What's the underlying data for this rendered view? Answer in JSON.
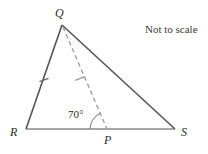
{
  "figure": {
    "type": "geometry-diagram",
    "background_color": "#ffffff",
    "note": "Not to scale",
    "solid_stroke_color": "#555555",
    "dashed_stroke_color": "#9a9a9a",
    "baseline_stroke_color": "#8a8a8a",
    "label_color": "#2b2b2b",
    "vertices": [
      {
        "name": "Q",
        "label": "Q",
        "x": 62,
        "y": 25,
        "label_x": 55,
        "label_y": 7
      },
      {
        "name": "R",
        "label": "R",
        "x": 26,
        "y": 129,
        "label_x": 10,
        "label_y": 126
      },
      {
        "name": "S",
        "label": "S",
        "x": 175,
        "y": 129,
        "label_x": 181,
        "label_y": 126
      },
      {
        "name": "P",
        "label": "P",
        "x": 107,
        "y": 129,
        "label_x": 104,
        "label_y": 134
      }
    ],
    "segments": [
      {
        "name": "side-RQ",
        "from": "R",
        "to": "Q",
        "style": "solid",
        "ticks": 1
      },
      {
        "name": "side-QS",
        "from": "Q",
        "to": "S",
        "style": "solid",
        "ticks": 0
      },
      {
        "name": "base-RS",
        "from": "R",
        "to": "S",
        "style": "solid",
        "ticks": 0
      },
      {
        "name": "cevian-QP",
        "from": "Q",
        "to": "P",
        "style": "dashed",
        "ticks": 1
      }
    ],
    "angles": [
      {
        "name": "angle-QPR",
        "at": "P",
        "value": "70",
        "unit": "°",
        "label": "70°",
        "label_x": 68,
        "label_y": 109
      }
    ]
  }
}
